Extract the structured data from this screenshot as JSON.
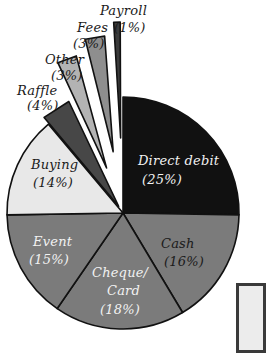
{
  "chart_data": {
    "type": "pie",
    "title": "",
    "categories": [
      "Direct debit",
      "Cash",
      "Cheque/Card",
      "Event",
      "Buying",
      "Raffle",
      "Other",
      "Fees",
      "Payroll"
    ],
    "values": [
      25,
      16,
      18,
      15,
      14,
      4,
      3,
      3,
      1
    ],
    "unit": "%",
    "exploded": [
      "Raffle",
      "Other",
      "Fees",
      "Payroll"
    ],
    "start_angle": "12 o'clock",
    "direction": "clockwise",
    "legend": "none (direct labels)",
    "colors": {
      "Direct debit": "#111111",
      "Cash": "#7b7b7b",
      "Cheque/Card": "#7b7b7b",
      "Event": "#7b7b7b",
      "Buying": "#e8e8e8",
      "Raffle": "#474747",
      "Other": "#b3b3b3",
      "Fees": "#8e8e8e",
      "Payroll": "#3b3b3b"
    }
  },
  "labels": {
    "payroll": "Payroll",
    "payroll_pct": "(1%)",
    "fees": "Fees",
    "fees_pct": "(3%)",
    "other": "Other",
    "other_pct": "(3%)",
    "raffle": "Raffle",
    "raffle_pct": "(4%)",
    "direct_debit": "Direct debit",
    "direct_debit_pct": "(25%)",
    "buying": "Buying",
    "buying_pct": "(14%)",
    "event": "Event",
    "event_pct": "(15%)",
    "cash": "Cash",
    "cash_pct": "(16%)",
    "cheque_line1": "Cheque/",
    "cheque_line2": "Card",
    "cheque_pct": "(18%)"
  }
}
